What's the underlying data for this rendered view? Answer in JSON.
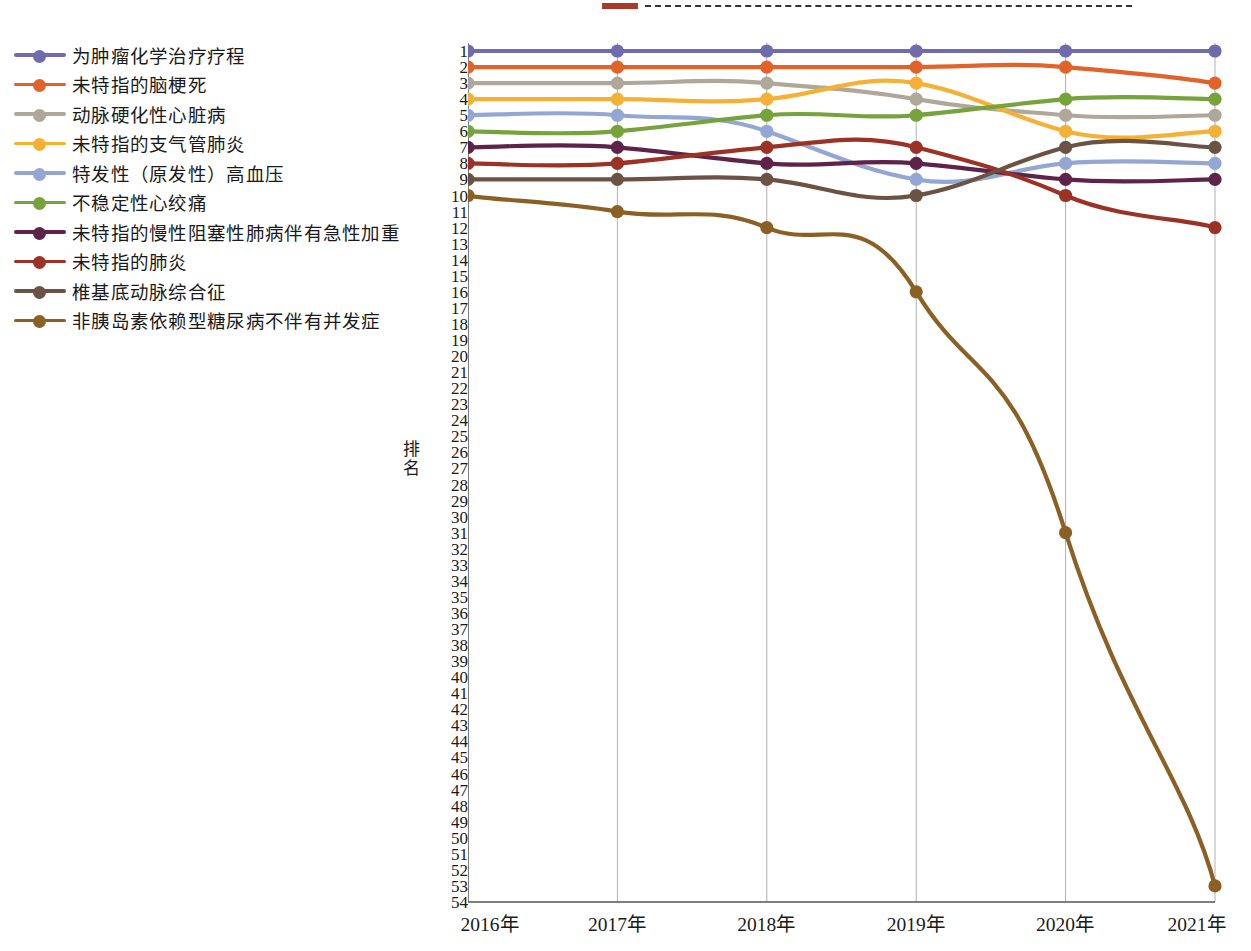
{
  "top_strip": {
    "swatch_color": "#a83a2c",
    "dash_color": "#333333"
  },
  "axis": {
    "y_title": "排名",
    "y_ticks": [
      1,
      2,
      3,
      4,
      5,
      6,
      7,
      8,
      9,
      10,
      11,
      12,
      13,
      14,
      15,
      16,
      17,
      18,
      19,
      20,
      21,
      22,
      23,
      24,
      25,
      26,
      27,
      28,
      29,
      30,
      31,
      32,
      33,
      34,
      35,
      36,
      37,
      38,
      39,
      40,
      41,
      42,
      43,
      44,
      45,
      46,
      47,
      48,
      49,
      50,
      51,
      52,
      53,
      54
    ],
    "y_min": 1,
    "y_max": 54,
    "x_ticks": [
      "2016年",
      "2017年",
      "2018年",
      "2019年",
      "2020年",
      "2021年"
    ]
  },
  "chart_data": {
    "type": "line",
    "title": "",
    "xlabel": "",
    "ylabel": "排名",
    "categories": [
      "2016年",
      "2017年",
      "2018年",
      "2019年",
      "2020年",
      "2021年"
    ],
    "ylim": [
      1,
      54
    ],
    "y_inverted": true,
    "grid": "vertical",
    "legend_position": "left",
    "series": [
      {
        "name": "为肿瘤化学治疗疗程",
        "color": "#6f6bad",
        "values": [
          1,
          1,
          1,
          1,
          1,
          1
        ]
      },
      {
        "name": "未特指的脑梗死",
        "color": "#e2632a",
        "values": [
          2,
          2,
          2,
          2,
          2,
          3
        ]
      },
      {
        "name": "动脉硬化性心脏病",
        "color": "#b0a79b",
        "values": [
          3,
          3,
          3,
          4,
          5,
          5
        ]
      },
      {
        "name": "未特指的支气管肺炎",
        "color": "#f5b136",
        "values": [
          4,
          4,
          4,
          3,
          6,
          6
        ]
      },
      {
        "name": "特发性（原发性）高血压",
        "color": "#93a6d4",
        "values": [
          5,
          5,
          6,
          9,
          8,
          8
        ]
      },
      {
        "name": "不稳定性心绞痛",
        "color": "#77a33c",
        "values": [
          6,
          6,
          5,
          5,
          4,
          4
        ]
      },
      {
        "name": "未特指的慢性阻塞性肺病伴有急性加重",
        "color": "#5e2348",
        "values": [
          7,
          7,
          8,
          8,
          9,
          9
        ]
      },
      {
        "name": "未特指的肺炎",
        "color": "#9b3225",
        "values": [
          8,
          8,
          7,
          7,
          10,
          12
        ]
      },
      {
        "name": "椎基底动脉综合征",
        "color": "#6b5243",
        "values": [
          9,
          9,
          9,
          10,
          7,
          7
        ]
      },
      {
        "name": "非胰岛素依赖型糖尿病不伴有并发症",
        "color": "#8a6024",
        "values": [
          10,
          11,
          12,
          16,
          31,
          53
        ]
      }
    ]
  }
}
